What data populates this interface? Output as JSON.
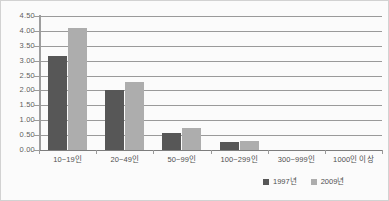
{
  "chart_data": {
    "type": "bar",
    "title": "",
    "subtitle": "",
    "xlabel": "",
    "ylabel": "",
    "ylim": [
      0,
      4.5
    ],
    "ytick_step": 0.5,
    "grid": true,
    "legend_position": "bottom-right",
    "categories": [
      "10~19인",
      "20~49인",
      "50~99인",
      "100~299인",
      "300~999인",
      "1000인 이상"
    ],
    "ytick_labels": [
      "4.50",
      "4.00",
      "3.50",
      "3.00",
      "2.50",
      "2.00",
      "1.50",
      "1.00",
      "0.50",
      "0.00"
    ],
    "ytick_values": [
      4.5,
      4.0,
      3.5,
      3.0,
      2.5,
      2.0,
      1.5,
      1.0,
      0.5,
      0.0
    ],
    "series": [
      {
        "name": "1997년",
        "color": "#575757",
        "values": [
          3.15,
          2.0,
          0.57,
          0.27,
          0.0,
          0.0
        ]
      },
      {
        "name": "2009년",
        "color": "#adadad",
        "values": [
          4.1,
          2.3,
          0.75,
          0.3,
          0.0,
          0.0
        ]
      }
    ]
  },
  "colors": {
    "series_1997": "#575757",
    "series_2009": "#adadad",
    "gridline": "#9a9a9a",
    "axis": "#9e9e9e",
    "text": "#4f4f4f",
    "border": "#d2d2d2",
    "background": "#fbfbfb"
  }
}
